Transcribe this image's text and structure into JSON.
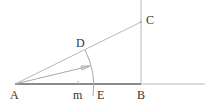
{
  "diagram": {
    "type": "geometric-construction",
    "points": {
      "A": {
        "label": "A"
      },
      "B": {
        "label": "B"
      },
      "C": {
        "label": "C"
      },
      "D": {
        "label": "D"
      },
      "E": {
        "label": "E"
      },
      "m": {
        "label": "m"
      }
    },
    "segments": [
      {
        "name": "AB",
        "style": "thick"
      },
      {
        "name": "B-extension",
        "style": "thin"
      },
      {
        "name": "vertical-through-B",
        "style": "thin"
      },
      {
        "name": "AC",
        "style": "thin"
      },
      {
        "name": "arrow-from-A",
        "style": "thin"
      }
    ],
    "arcs": [
      {
        "name": "arc-DE",
        "center": "A"
      }
    ],
    "colors": {
      "line": "#b8b8b8",
      "thick_line": "#8a8a8a",
      "label": "#333333"
    }
  }
}
